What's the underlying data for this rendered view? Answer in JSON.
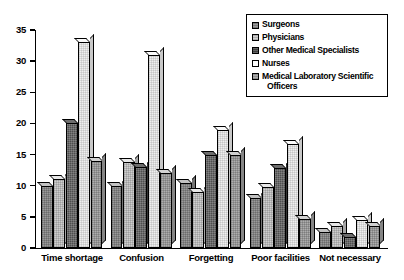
{
  "chart_data": {
    "type": "bar",
    "title": "",
    "subtitle": "",
    "xlabel": "",
    "ylabel": "",
    "ylim": [
      0,
      35
    ],
    "yticks": [
      0,
      5,
      10,
      15,
      20,
      25,
      30,
      35
    ],
    "ytick_labels": [
      "0",
      "5",
      "10",
      "15",
      "20",
      "25",
      "30",
      "35"
    ],
    "grid": false,
    "legend_position": "top-right",
    "categories": [
      "Time shortage",
      "Confusion",
      "Forgetting",
      "Poor facilities",
      "Not necessary"
    ],
    "series": [
      {
        "name": "Surgeons",
        "values": [
          10,
          10,
          10.5,
          8,
          2.5
        ]
      },
      {
        "name": "Physicians",
        "values": [
          11,
          13.8,
          9,
          9.8,
          3.6
        ]
      },
      {
        "name": "Other Medical Specialists",
        "values": [
          20,
          13,
          15,
          12.8,
          1.8
        ]
      },
      {
        "name": "Nurses",
        "values": [
          33,
          31,
          19,
          16.7,
          4.5
        ]
      },
      {
        "name": "Medical Laboratory Scientific Officers",
        "values": [
          14,
          12,
          15,
          4.7,
          3.6
        ]
      }
    ]
  },
  "legend": {
    "entries": [
      {
        "label": "Surgeons",
        "label_cont": ""
      },
      {
        "label": "Physicians",
        "label_cont": ""
      },
      {
        "label": "Other Medical Specialists",
        "label_cont": ""
      },
      {
        "label": "Nurses",
        "label_cont": ""
      },
      {
        "label": "Medical Laboratory Scientific",
        "label_cont": "Officers"
      }
    ]
  },
  "colors": {
    "series": [
      "#9a9a9a",
      "#cfcfcf",
      "#4e4e4e",
      "#efefef",
      "#adadad"
    ],
    "axis": "#000000",
    "background": "#ffffff"
  }
}
